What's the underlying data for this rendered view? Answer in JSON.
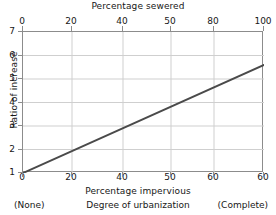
{
  "chart_data": {
    "type": "line",
    "title": "",
    "top_axis": {
      "label": "Percentage sewered",
      "ticks": [
        0,
        20,
        40,
        50,
        80,
        100
      ],
      "tick_labels": [
        "0",
        "20",
        "40",
        "50",
        "80",
        "100"
      ],
      "tick_positions_px": [
        0,
        49,
        100,
        148,
        191,
        241
      ]
    },
    "xlabel": "Percentage impervious",
    "x_ticks": [
      0,
      20,
      40,
      50,
      60,
      60
    ],
    "x_tick_labels": [
      "0",
      "20",
      "40",
      "50",
      "60",
      "60"
    ],
    "x_tick_positions_px": [
      0,
      49,
      100,
      148,
      191,
      241
    ],
    "ylabel": "Ratio of increase",
    "ylim": [
      1,
      7
    ],
    "y_ticks": [
      1,
      2,
      3,
      4,
      5,
      6,
      7
    ],
    "y_tick_labels": [
      "1",
      "2",
      "3",
      "4",
      "5",
      "6",
      "7"
    ],
    "grid": true,
    "legend": "none",
    "series": [
      {
        "name": "Ratio of increase vs degree of urbanization",
        "x": [
          0,
          60
        ],
        "values": [
          1.0,
          5.6
        ],
        "points_px": [
          {
            "x": 0,
            "y": 141
          },
          {
            "x": 241,
            "y": 33
          }
        ],
        "color": "#4a4a4a",
        "width_px": 2
      }
    ],
    "caption": {
      "left": "(None)",
      "center": "Degree of urbanization",
      "right": "(Complete)"
    }
  },
  "colors": {
    "line": "#4a4a4a",
    "grid": "#cfcfcf",
    "frame": "#8c8c8c",
    "text": "#171717",
    "background": "#ffffff"
  }
}
